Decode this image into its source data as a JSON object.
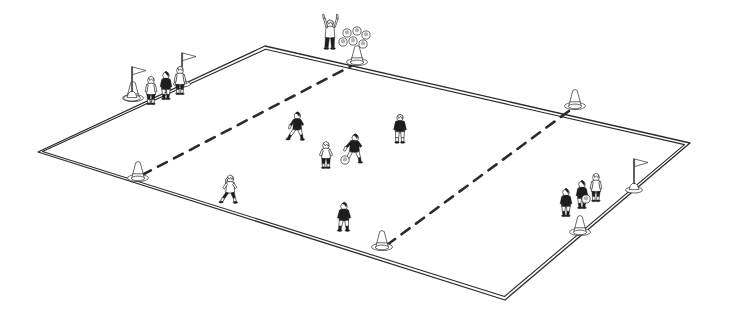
{
  "diagram": {
    "title": "Soccer training grid drill diagram",
    "style": "black and white line illustration, isometric view",
    "background_color": "#ffffff",
    "line_color": "#2b2b2b",
    "dark_fill_color": "#1d1d1d",
    "light_fill_color": "#ffffff"
  },
  "field": {
    "name": "rectangular training grid",
    "border_style": "double line",
    "corners": {
      "left": [
        38,
        152
      ],
      "top": [
        265,
        46
      ],
      "right": [
        690,
        143
      ],
      "bottom": [
        505,
        300
      ]
    },
    "divider_lines": [
      {
        "name": "left dashed divider",
        "style": "dashed",
        "from_cone": "left-edge-cone",
        "to_cone": "top-center-cone"
      },
      {
        "name": "right dashed divider",
        "style": "dashed",
        "from_cone": "bottom-center-cone",
        "to_cone": "right-edge-cone"
      }
    ],
    "zones": 3
  },
  "cones": [
    {
      "name": "top-center-cone",
      "x": 357,
      "y": 62,
      "note": "on top-right sideline, start of left dashed divider"
    },
    {
      "name": "right-edge-cone",
      "x": 575,
      "y": 106,
      "note": "on top-right sideline, end of right dashed divider"
    },
    {
      "name": "left-edge-cone",
      "x": 138,
      "y": 178,
      "note": "on bottom-left sideline, end of left dashed divider"
    },
    {
      "name": "bottom-center-cone",
      "x": 382,
      "y": 247,
      "note": "on bottom-left sideline, start of right dashed divider"
    },
    {
      "name": "left-corner-queue-cone",
      "x": 133,
      "y": 98,
      "note": "beside left player queue"
    },
    {
      "name": "right-corner-queue-cone",
      "x": 580,
      "y": 232,
      "note": "beside right player queue"
    }
  ],
  "flags": [
    {
      "name": "left-queue-flag-front",
      "x": 132,
      "y": 66,
      "height": 32
    },
    {
      "name": "left-queue-flag-rear",
      "x": 182,
      "y": 50,
      "height": 34
    },
    {
      "name": "right-queue-flag",
      "x": 634,
      "y": 158,
      "height": 32
    }
  ],
  "groups": [
    {
      "name": "left-player-queue",
      "position": "upper-left sideline",
      "player_count": 3,
      "description": "three players lined up waiting at the left corner behind marker flags"
    },
    {
      "name": "right-player-queue",
      "position": "lower-right sideline",
      "player_count": 3,
      "description": "three players lined up waiting at the right corner beside a marker flag"
    }
  ],
  "coach": {
    "name": "coach-with-ball-supply",
    "x": 330,
    "y": 22,
    "description": "coach standing behind the top cone next to a pile of balls",
    "ball_pile_count": 6,
    "ball_pile_position": [
      352,
      38
    ]
  },
  "players": [
    {
      "name": "player-left-queue-1",
      "x": 151,
      "y": 80,
      "shirt": "light",
      "pose": "standing in line",
      "has_ball": false
    },
    {
      "name": "player-left-queue-2",
      "x": 164,
      "y": 77,
      "shirt": "dark",
      "pose": "standing in line",
      "has_ball": false
    },
    {
      "name": "player-left-queue-3",
      "x": 176,
      "y": 73,
      "shirt": "light",
      "pose": "standing in line",
      "has_ball": false
    },
    {
      "name": "player-runner-upper-middle",
      "x": 297,
      "y": 112,
      "shirt": "dark",
      "pose": "running",
      "has_ball": false
    },
    {
      "name": "player-defender-right-middle",
      "x": 400,
      "y": 116,
      "shirt": "dark",
      "pose": "facing away, jogging",
      "has_ball": false
    },
    {
      "name": "player-light-shirt-centre",
      "x": 326,
      "y": 143,
      "shirt": "light",
      "pose": "crouched, defending",
      "has_ball": false
    },
    {
      "name": "player-dribbler-centre",
      "x": 352,
      "y": 140,
      "shirt": "dark",
      "pose": "dribbling",
      "has_ball": true,
      "ball_position": [
        345,
        160
      ]
    },
    {
      "name": "player-runner-lower-left",
      "x": 228,
      "y": 180,
      "shirt": "light",
      "pose": "running",
      "has_ball": false
    },
    {
      "name": "player-lower-centre",
      "x": 344,
      "y": 205,
      "shirt": "dark",
      "pose": "walking forward",
      "has_ball": false
    },
    {
      "name": "player-right-queue-1",
      "x": 566,
      "y": 192,
      "shirt": "dark",
      "pose": "standing in line",
      "has_ball": false
    },
    {
      "name": "player-right-queue-2",
      "x": 582,
      "y": 183,
      "shirt": "dark",
      "pose": "standing in line",
      "has_ball": true,
      "ball_position": [
        586,
        198
      ]
    },
    {
      "name": "player-right-queue-3",
      "x": 594,
      "y": 177,
      "shirt": "light",
      "pose": "standing in line",
      "has_ball": false
    }
  ],
  "balls": [
    {
      "name": "ball-dribbler",
      "x": 345,
      "y": 160,
      "r": 4
    },
    {
      "name": "ball-right-queue",
      "x": 586,
      "y": 199,
      "r": 4
    },
    {
      "name": "ball-pile-1",
      "x": 347,
      "y": 33,
      "r": 4
    },
    {
      "name": "ball-pile-2",
      "x": 357,
      "y": 31,
      "r": 4
    },
    {
      "name": "ball-pile-3",
      "x": 366,
      "y": 35,
      "r": 4
    },
    {
      "name": "ball-pile-4",
      "x": 343,
      "y": 42,
      "r": 4
    },
    {
      "name": "ball-pile-5",
      "x": 353,
      "y": 41,
      "r": 4
    },
    {
      "name": "ball-pile-6",
      "x": 363,
      "y": 44,
      "r": 4
    }
  ]
}
